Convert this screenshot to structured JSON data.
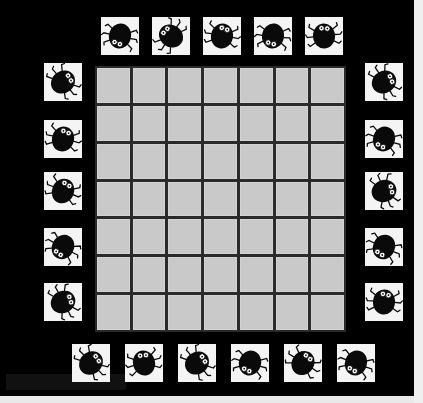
{
  "scene": {
    "title": "Bug / Beetle Board Game",
    "description": "Top-down photo of a black game board with a light gray 7x7 playing grid in the center, surrounded on all four sides by white square tiles each printed with a black beetle.",
    "board_color": "#000000",
    "grid_cell_color": "#c9c9c9",
    "grid_line_color": "#2a2a2a",
    "tile_background_color": "#f4f4f4",
    "bug_body_color": "#0a0a0a",
    "bug_eye_color": "#ffffff"
  },
  "grid": {
    "name": "playing-grid",
    "columns": 7,
    "rows": 7,
    "cell_count": 49,
    "occupied_cells": 0,
    "left": 95,
    "top": 66,
    "width": 251,
    "height": 266
  },
  "tiles": {
    "total": 21,
    "icon_name": "bug-icon",
    "top": [
      {
        "id": "top-1",
        "x": 101,
        "y": 17,
        "size": 38,
        "rotation": 14
      },
      {
        "id": "top-2",
        "x": 152,
        "y": 17,
        "size": 38,
        "rotation": 126
      },
      {
        "id": "top-3",
        "x": 203,
        "y": 17,
        "size": 38,
        "rotation": 192
      },
      {
        "id": "top-4",
        "x": 254,
        "y": 17,
        "size": 38,
        "rotation": 8
      },
      {
        "id": "top-5",
        "x": 305,
        "y": 17,
        "size": 38,
        "rotation": 176
      }
    ],
    "left": [
      {
        "id": "left-1",
        "x": 44,
        "y": 63,
        "size": 38,
        "rotation": 232
      },
      {
        "id": "left-2",
        "x": 44,
        "y": 120,
        "size": 38,
        "rotation": 196
      },
      {
        "id": "left-3",
        "x": 44,
        "y": 172,
        "size": 38,
        "rotation": 204
      },
      {
        "id": "left-4",
        "x": 44,
        "y": 228,
        "size": 38,
        "rotation": 30
      },
      {
        "id": "left-5",
        "x": 44,
        "y": 283,
        "size": 38,
        "rotation": 244
      }
    ],
    "right": [
      {
        "id": "right-1",
        "x": 365,
        "y": 63,
        "size": 38,
        "rotation": 240
      },
      {
        "id": "right-2",
        "x": 365,
        "y": 120,
        "size": 38,
        "rotation": 20
      },
      {
        "id": "right-3",
        "x": 365,
        "y": 172,
        "size": 38,
        "rotation": 250
      },
      {
        "id": "right-4",
        "x": 365,
        "y": 228,
        "size": 38,
        "rotation": 26
      },
      {
        "id": "right-5",
        "x": 365,
        "y": 283,
        "size": 38,
        "rotation": 186
      }
    ],
    "bottom": [
      {
        "id": "bottom-1",
        "x": 72,
        "y": 344,
        "size": 38,
        "rotation": 228
      },
      {
        "id": "bottom-2",
        "x": 125,
        "y": 344,
        "size": 38,
        "rotation": 166
      },
      {
        "id": "bottom-3",
        "x": 178,
        "y": 344,
        "size": 38,
        "rotation": 232
      },
      {
        "id": "bottom-4",
        "x": 231,
        "y": 344,
        "size": 38,
        "rotation": 18
      },
      {
        "id": "bottom-5",
        "x": 284,
        "y": 344,
        "size": 38,
        "rotation": 214
      },
      {
        "id": "bottom-6",
        "x": 337,
        "y": 344,
        "size": 38,
        "rotation": 22
      }
    ]
  }
}
